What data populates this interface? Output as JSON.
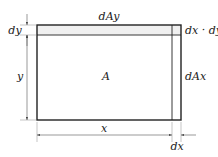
{
  "diagram": {
    "title": "",
    "colors": {
      "stroke": "#222222",
      "strip_fill": "#f0f0f0",
      "dimension": "#555555",
      "background": "#ffffff"
    },
    "regions": [
      {
        "id": "A",
        "label": "A",
        "description": "main area x by y"
      },
      {
        "id": "dAy",
        "label": "dAy",
        "description": "top strip of height dy"
      },
      {
        "id": "dAx",
        "label": "dAx",
        "description": "right strip of width dx"
      },
      {
        "id": "corner",
        "label": "dx · dy",
        "description": "corner element"
      }
    ],
    "dimensions": [
      {
        "id": "x",
        "label": "x",
        "orientation": "horizontal"
      },
      {
        "id": "dx",
        "label": "dx",
        "orientation": "horizontal"
      },
      {
        "id": "y",
        "label": "y",
        "orientation": "vertical"
      },
      {
        "id": "dy",
        "label": "dy",
        "orientation": "vertical"
      }
    ]
  },
  "labels": {
    "A": "A",
    "dAy": "dAy",
    "dAx": "dAx",
    "corner": "dx · dy",
    "x": "x",
    "y": "y",
    "dx": "dx",
    "dy": "dy"
  }
}
